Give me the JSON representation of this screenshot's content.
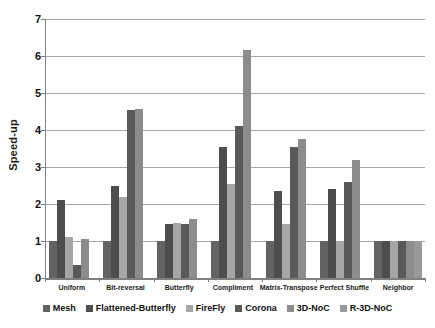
{
  "chart_data": {
    "type": "bar",
    "title": "",
    "xlabel": "",
    "ylabel": "Speed-up",
    "ylim": [
      0,
      7
    ],
    "ytick_labels": [
      "0",
      "1",
      "2",
      "3",
      "4",
      "5",
      "6",
      "7"
    ],
    "ytick_values": [
      0,
      1,
      2,
      3,
      4,
      5,
      6,
      7
    ],
    "grid": true,
    "legend_position": "bottom",
    "categories": [
      "Uniform",
      "Bit-reversal",
      "Butterfly",
      "Compliment",
      "Matrix-Transpose",
      "Perfect Shuffle",
      "Neighbor"
    ],
    "series": [
      {
        "name": "Mesh",
        "color": "#636363",
        "values": [
          1.0,
          1.0,
          1.0,
          1.0,
          1.0,
          1.0,
          1.0
        ]
      },
      {
        "name": "Flattened-Butterfly",
        "color": "#4d4d4d",
        "values": [
          2.1,
          2.5,
          1.45,
          3.55,
          2.35,
          2.4,
          1.0
        ]
      },
      {
        "name": "FireFly",
        "color": "#a6a6a6",
        "values": [
          1.1,
          2.2,
          1.5,
          2.55,
          1.45,
          1.0,
          1.0
        ]
      },
      {
        "name": "Corona",
        "color": "#595959",
        "values": [
          0.35,
          4.55,
          1.45,
          4.1,
          3.55,
          2.6,
          1.0
        ]
      },
      {
        "name": "3D-NoC",
        "color": "#8c8c8c",
        "values": [
          1.05,
          4.57,
          1.6,
          6.15,
          3.75,
          3.2,
          1.0
        ]
      },
      {
        "name": "R-3D-NoC",
        "color": "#999999",
        "values": [
          0.0,
          0.0,
          0.0,
          0.0,
          0.0,
          0.0,
          1.0
        ]
      }
    ]
  },
  "legend": {
    "items": [
      {
        "label": "Mesh",
        "color": "#636363"
      },
      {
        "label": "Flattened-Butterfly",
        "color": "#4d4d4d"
      },
      {
        "label": "FireFly",
        "color": "#a6a6a6"
      },
      {
        "label": "Corona",
        "color": "#595959"
      },
      {
        "label": "3D-NoC",
        "color": "#8c8c8c"
      },
      {
        "label": "R-3D-NoC",
        "color": "#999999"
      }
    ]
  },
  "axis": {
    "y_title": "Speed-up"
  },
  "colors": {
    "grid": "#a6a6a6",
    "axis": "#808080",
    "text": "#111111",
    "background": "#ffffff"
  }
}
